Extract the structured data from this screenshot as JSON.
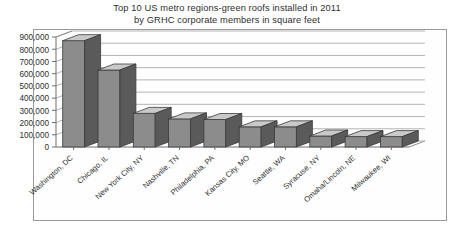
{
  "chart_data": {
    "type": "bar",
    "title": "Top 10 US metro regions-green roofs installed in 2011 by GRHC corporate members in square feet",
    "title_line1": "Top 10 US metro regions-green roofs installed in 2011",
    "title_line2": "by GRHC corporate members in square feet",
    "xlabel": "",
    "ylabel": "",
    "ylim": [
      0,
      900000
    ],
    "grid": true,
    "legend": "none",
    "style": "3d-column",
    "categories": [
      "Washington, DC",
      "Chicago, IL",
      "New York City, NY",
      "Nashville, TN",
      "Philadelphia, PA",
      "Kansas City, MO",
      "Seattle, WA",
      "Syracuse, NY",
      "Omaha/Lincoln, NE",
      "Milwaukee, WI"
    ],
    "values": [
      870000,
      630000,
      275000,
      230000,
      225000,
      165000,
      165000,
      90000,
      85000,
      85000
    ],
    "ytick_labels": [
      "900,000",
      "800,000",
      "700,000",
      "600,000",
      "500,000",
      "400,000",
      "300,000",
      "200,000",
      "100,000",
      "0"
    ],
    "ytick_values": [
      900000,
      800000,
      700000,
      600000,
      500000,
      400000,
      300000,
      200000,
      100000,
      0
    ],
    "colors": {
      "bar_face": "#8c8c8c",
      "bar_top": "#c9c9c9",
      "bar_side": "#5a5a5a",
      "bar_outline": "#3a3a3a",
      "grid": "#b4b4b4",
      "axis": "#6f6f6f",
      "frame": "#9a9a9a",
      "background": "#ffffff",
      "text": "#2e2e2e"
    }
  }
}
